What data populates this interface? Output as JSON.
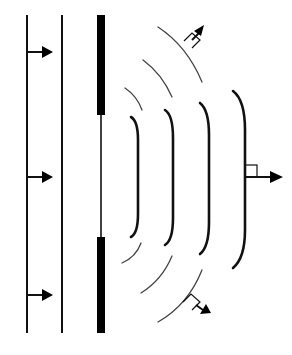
{
  "diagram": {
    "title": "",
    "colors": {
      "background": "#ffffff",
      "stroke": "#111111",
      "thin_arc": "#444444",
      "barrier": "#000000"
    },
    "incident_plane_wavefronts": [
      {
        "x": 27,
        "y1": 15,
        "y2": 333
      },
      {
        "x": 62,
        "y1": 15,
        "y2": 333
      }
    ],
    "incident_rays": [
      {
        "x1": 27,
        "y": 52,
        "x2": 52,
        "direction": "right"
      },
      {
        "x1": 27,
        "y": 177,
        "x2": 52,
        "direction": "right"
      },
      {
        "x1": 27,
        "y": 295,
        "x2": 52,
        "direction": "right"
      }
    ],
    "barrier": {
      "x": 97,
      "width": 8,
      "top_segment": {
        "y1": 15,
        "y2": 115
      },
      "bottom_segment": {
        "y1": 237,
        "y2": 333
      },
      "slit_line": {
        "x": 101,
        "y1": 115,
        "y2": 237
      }
    },
    "diffracted_wavefronts": [
      {
        "top": [
          131,
          117
        ],
        "x": 138,
        "bottom": [
          131,
          237
        ]
      },
      {
        "top": [
          165,
          110
        ],
        "x": 173,
        "bottom": [
          165,
          245
        ]
      },
      {
        "top": [
          200,
          103
        ],
        "x": 209,
        "bottom": [
          200,
          254
        ]
      },
      {
        "top": [
          233,
          91
        ],
        "x": 245,
        "bottom": [
          233,
          268
        ]
      }
    ],
    "edge_arcs_upper": [
      {
        "from": [
          125,
          88
        ],
        "to": [
          142,
          110
        ]
      },
      {
        "from": [
          143,
          60
        ],
        "to": [
          172,
          97
        ]
      },
      {
        "from": [
          158,
          27
        ],
        "to": [
          202,
          82
        ]
      }
    ],
    "edge_arcs_lower": [
      {
        "from": [
          141,
          243
        ],
        "to": [
          122,
          263
        ]
      },
      {
        "from": [
          172,
          256
        ],
        "to": [
          141,
          293
        ]
      },
      {
        "from": [
          202,
          270
        ],
        "to": [
          158,
          322
        ]
      }
    ],
    "propagation_arrows": [
      {
        "label": "forward",
        "from": [
          245,
          177
        ],
        "to": [
          282,
          177
        ],
        "right_angle_marker": true
      },
      {
        "label": "upper-diffracted",
        "from": [
          188,
          45
        ],
        "to": [
          203,
          27
        ],
        "right_angle_marker": true
      },
      {
        "label": "lower-diffracted",
        "from": [
          188,
          302
        ],
        "to": [
          210,
          313
        ],
        "right_angle_marker": true
      }
    ]
  }
}
